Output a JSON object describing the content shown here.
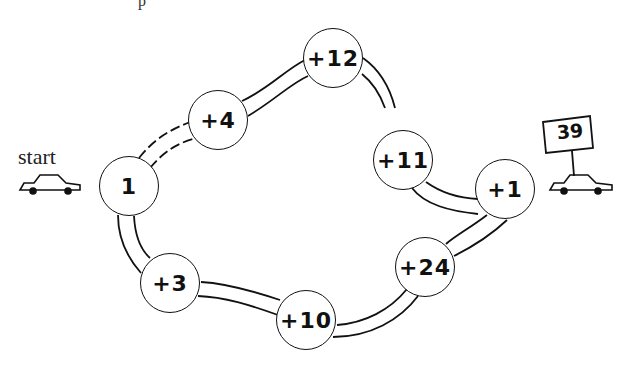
{
  "diagram": {
    "type": "addition-path-puzzle",
    "start_label": "start",
    "goal_sign_value": "39",
    "top_fragment": "p",
    "nodes": [
      {
        "id": "start",
        "label": "1",
        "x": 129,
        "y": 186
      },
      {
        "id": "n2",
        "label": "+4",
        "x": 218,
        "y": 120
      },
      {
        "id": "n3",
        "label": "+12",
        "x": 333,
        "y": 58
      },
      {
        "id": "n4",
        "label": "+11",
        "x": 403,
        "y": 160
      },
      {
        "id": "end",
        "label": "+1",
        "x": 505,
        "y": 189
      },
      {
        "id": "n6",
        "label": "+24",
        "x": 425,
        "y": 267
      },
      {
        "id": "n7",
        "label": "+10",
        "x": 306,
        "y": 320
      },
      {
        "id": "n8",
        "label": "+3",
        "x": 170,
        "y": 283
      }
    ],
    "paths": {
      "upper_route": [
        "1",
        "+4",
        "+12",
        "+11",
        "+1"
      ],
      "lower_route": [
        "1",
        "+3",
        "+10",
        "+24",
        "+1"
      ]
    },
    "icons": [
      "start-car-icon",
      "goal-car-icon",
      "goal-sign-icon"
    ]
  }
}
